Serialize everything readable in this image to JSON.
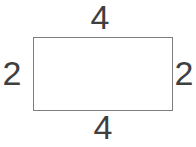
{
  "diagram": {
    "type": "geometry-figure",
    "shape": "rectangle",
    "labels": {
      "top": "4",
      "bottom": "4",
      "left": "2",
      "right": "2"
    },
    "dimensions": {
      "width_value": "4",
      "height_value": "2"
    },
    "colors": {
      "background": "#ffffff",
      "line": "#7d7d7d",
      "text": "#3f3f3f"
    }
  }
}
